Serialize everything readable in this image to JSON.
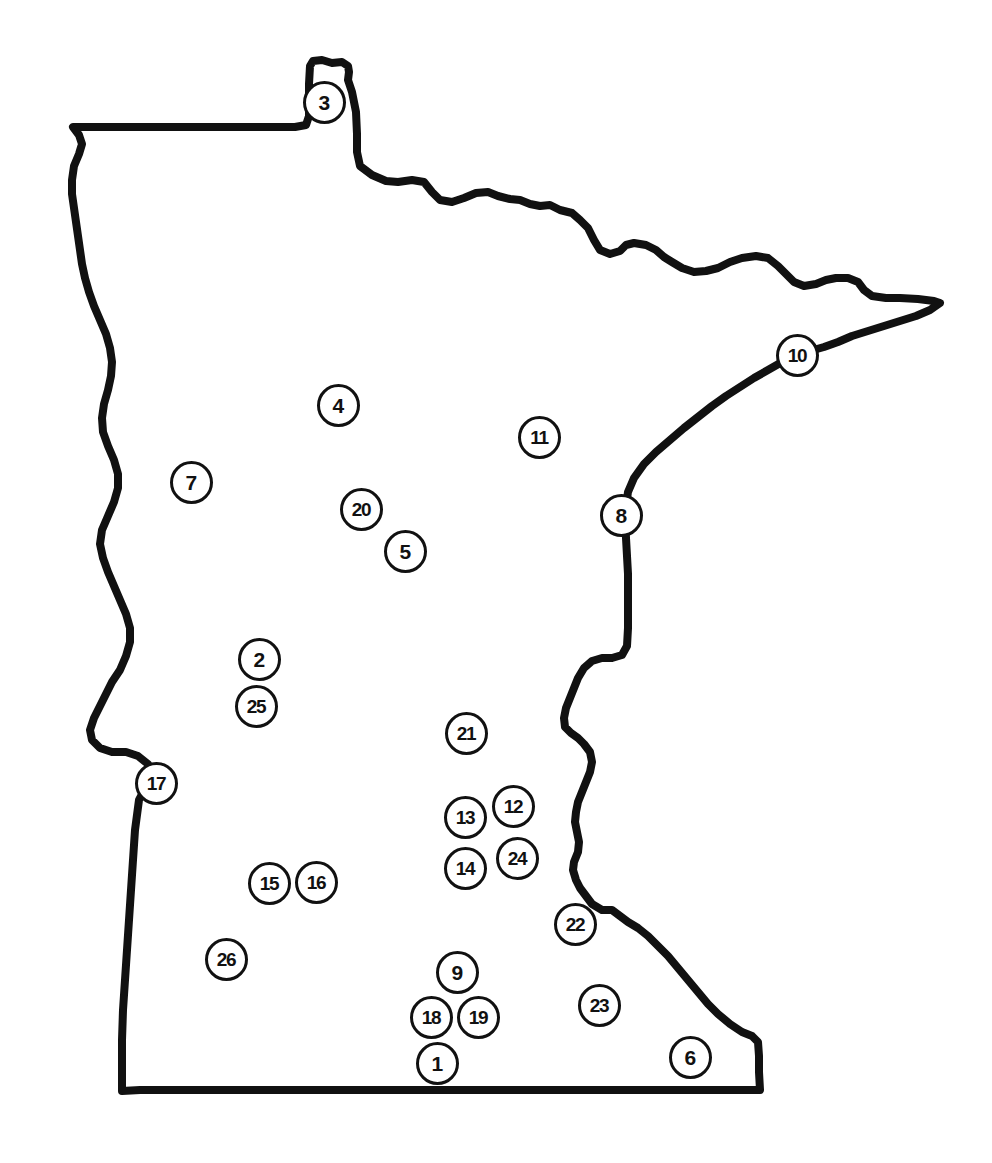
{
  "figure": {
    "kind": "reference-map",
    "width": 992,
    "height": 1163,
    "background_color": "#ffffff",
    "outline_color": "#111111",
    "marker_fill_color": "#ffffff",
    "marker_border_color": "#111111",
    "marker_label_color": "#111111"
  },
  "markers": [
    {
      "label": "3",
      "x": 324,
      "y": 102
    },
    {
      "label": "10",
      "x": 797,
      "y": 355
    },
    {
      "label": "4",
      "x": 338,
      "y": 405
    },
    {
      "label": "11",
      "x": 539,
      "y": 437
    },
    {
      "label": "7",
      "x": 191,
      "y": 482
    },
    {
      "label": "20",
      "x": 361,
      "y": 509
    },
    {
      "label": "8",
      "x": 621,
      "y": 515
    },
    {
      "label": "5",
      "x": 405,
      "y": 551
    },
    {
      "label": "2",
      "x": 259,
      "y": 659
    },
    {
      "label": "25",
      "x": 256,
      "y": 706
    },
    {
      "label": "21",
      "x": 466,
      "y": 733
    },
    {
      "label": "17",
      "x": 156,
      "y": 783
    },
    {
      "label": "12",
      "x": 513,
      "y": 806
    },
    {
      "label": "13",
      "x": 465,
      "y": 817
    },
    {
      "label": "24",
      "x": 517,
      "y": 858
    },
    {
      "label": "14",
      "x": 465,
      "y": 868
    },
    {
      "label": "16",
      "x": 316,
      "y": 882
    },
    {
      "label": "15",
      "x": 269,
      "y": 883
    },
    {
      "label": "22",
      "x": 575,
      "y": 924
    },
    {
      "label": "26",
      "x": 226,
      "y": 959
    },
    {
      "label": "9",
      "x": 457,
      "y": 972
    },
    {
      "label": "23",
      "x": 599,
      "y": 1005
    },
    {
      "label": "18",
      "x": 431,
      "y": 1017
    },
    {
      "label": "19",
      "x": 478,
      "y": 1017
    },
    {
      "label": "6",
      "x": 690,
      "y": 1057
    },
    {
      "label": "1",
      "x": 437,
      "y": 1063
    }
  ],
  "outline": {
    "stroke_width": 8,
    "path": "M 310 66 L 313 61 L 322 60 L 332 63 L 342 62 L 348 66 L 349 72 L 348 80 L 352 92 L 356 112 L 357 134 L 357 152 L 360 166 L 372 175 L 386 181 L 398 182 L 412 180 L 424 182 L 432 192 L 440 200 L 452 202 L 464 198 L 476 193 L 488 192 L 498 196 L 510 199 L 520 200 L 530 204 L 540 206 L 550 205 L 560 210 L 572 213 L 580 220 L 588 228 L 594 240 L 600 250 L 610 254 L 620 251 L 626 245 L 634 243 L 646 245 L 656 250 L 664 257 L 672 262 L 682 268 L 694 272 L 706 271 L 718 268 L 730 262 L 742 258 L 756 256 L 768 258 L 778 266 L 786 274 L 794 282 L 804 286 L 816 284 L 826 280 L 836 278 L 848 278 L 858 282 L 864 290 L 872 296 L 886 298 L 900 298 L 918 299 L 934 301 L 940 303 L 930 310 L 916 316 L 900 321 L 884 326 L 868 331 L 852 336 L 838 342 L 824 347 L 810 351 L 796 356 L 782 362 L 768 370 L 754 378 L 740 387 L 726 396 L 712 406 L 698 417 L 684 428 L 670 440 L 656 452 L 644 464 L 634 478 L 628 492 L 626 506 L 625 520 L 626 538 L 627 556 L 628 574 L 628 592 L 628 610 L 628 628 L 627 646 L 622 655 L 612 658 L 602 658 L 592 661 L 584 668 L 578 678 L 574 688 L 570 698 L 566 708 L 564 718 L 565 727 L 571 733 L 578 738 L 584 744 L 590 752 L 592 762 L 590 772 L 586 782 L 582 792 L 578 802 L 576 812 L 575 822 L 577 832 L 579 842 L 578 852 L 574 862 L 573 870 L 576 880 L 580 888 L 586 896 L 592 904 L 602 910 L 612 910 L 620 916 L 628 922 L 638 928 L 648 936 L 658 946 L 668 956 L 678 968 L 688 980 L 698 992 L 708 1004 L 718 1014 L 730 1024 L 742 1032 L 752 1036 L 758 1042 L 759 1056 L 759 1072 L 760 1090 L 740 1090 L 700 1090 L 640 1090 L 560 1090 L 470 1090 L 380 1090 L 290 1090 L 200 1090 L 140 1090 L 122 1091 L 122 1070 L 122 1040 L 123 1010 L 125 980 L 127 950 L 129 920 L 131 890 L 133 860 L 135 830 L 139 800 L 147 785 L 152 775 L 148 764 L 138 756 L 126 752 L 112 752 L 100 748 L 92 740 L 90 730 L 94 718 L 100 706 L 106 694 L 112 682 L 120 670 L 126 656 L 130 642 L 130 628 L 126 614 L 120 600 L 114 586 L 108 572 L 103 558 L 100 544 L 102 530 L 108 516 L 114 502 L 118 488 L 118 474 L 114 460 L 108 446 L 103 432 L 102 418 L 104 404 L 108 390 L 111 376 L 112 362 L 110 348 L 106 334 L 100 320 L 94 306 L 89 292 L 85 278 L 82 264 L 80 250 L 78 236 L 76 222 L 74 208 L 72 194 L 72 180 L 74 166 L 79 154 L 82 144 L 79 135 L 73 127 L 90 127 L 120 127 L 150 127 L 180 127 L 210 127 L 240 127 L 270 127 L 295 127 L 306 125 L 309 116 L 309 100 L 309 84 Z"
  }
}
